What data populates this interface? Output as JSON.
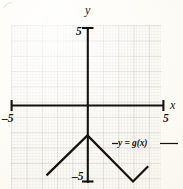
{
  "figure": {
    "kind": "coordinate-plane-graph",
    "background_color": "#fbfaf4",
    "ink_color": "#15120e",
    "grid_color": "#9696a0"
  },
  "axes": {
    "x_axis_label": "x",
    "y_axis_label": "y",
    "x_min_tick_label": "–5",
    "x_max_tick_label": "5",
    "y_min_tick_label": "–5",
    "y_max_tick_label": "5"
  },
  "annotations": {
    "function_label": "y = g(x)"
  },
  "chart_data": {
    "type": "line",
    "title": "",
    "xlabel": "x",
    "ylabel": "y",
    "xlim": [
      -5,
      5
    ],
    "ylim": [
      -5,
      5
    ],
    "grid": true,
    "grid_major_step": 1,
    "grid_minor_step": 0.2,
    "legend": "none",
    "series": [
      {
        "name": "y = g(x)",
        "x": [
          -2.7,
          0,
          3,
          4
        ],
        "y": [
          -4.6,
          -2,
          -5,
          -4
        ],
        "points": [
          [
            -2.7,
            -4.6
          ],
          [
            0,
            -2
          ],
          [
            3,
            -5
          ],
          [
            4,
            -4
          ]
        ],
        "color": "#15120e",
        "linewidth": 2
      }
    ],
    "annotations": [
      {
        "text": "y = g(x)",
        "x": 2.1,
        "y": -2.45,
        "leader_to": [
          3.55,
          -2.45
        ]
      }
    ]
  }
}
